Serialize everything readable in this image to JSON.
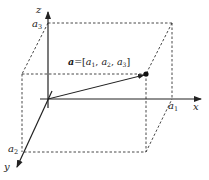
{
  "diagram": {
    "axes": {
      "x": {
        "label": "x"
      },
      "y": {
        "label": "y"
      },
      "z": {
        "label": "z"
      }
    },
    "components": {
      "a1": {
        "base": "a",
        "sub": "1"
      },
      "a2": {
        "base": "a",
        "sub": "2"
      },
      "a3": {
        "base": "a",
        "sub": "3"
      }
    },
    "vector_label": {
      "name": "a",
      "equals": "=[",
      "c1": "a",
      "s1": "1",
      "sep1": ", ",
      "c2": "a",
      "s2": "2",
      "sep2": ", ",
      "c3": "a",
      "s3": "3",
      "close": "]"
    },
    "colors": {
      "line": "#222222",
      "background": "#ffffff"
    }
  }
}
